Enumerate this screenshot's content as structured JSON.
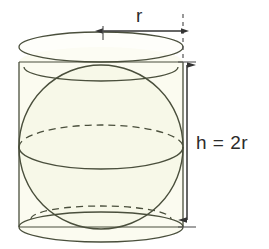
{
  "figure": {
    "background_color": "#ffffff",
    "stroke_color": "#4a4f3c",
    "fill_color": "#fbfbf0",
    "label_color": "#2b2b2b",
    "dimension_color": "#333333"
  },
  "labels": {
    "radius": "r",
    "height": "h = 2r"
  },
  "shapes": {
    "cylinder": {
      "name": "cylinder",
      "center_x": 101,
      "radius_x": 82,
      "top_ellipse_center_y": 62,
      "bottom_ellipse_center_y": 227,
      "ellipse_radius_y": 15
    },
    "sphere": {
      "name": "inscribed-sphere",
      "center_x": 101,
      "center_y": 147,
      "radius": 82,
      "equator_center_y": 147,
      "equator_radius_y": 22,
      "top_circle_center_y": 67,
      "top_circle_radius_x": 77,
      "top_circle_radius_y": 14,
      "bottom_circle_center_y": 219,
      "bottom_circle_radius_x": 70,
      "bottom_circle_radius_y": 13
    }
  },
  "dimensions": {
    "radius_arrow": {
      "name": "radius-dimension",
      "x_start": 103,
      "x_end": 183,
      "y": 31,
      "label": "r"
    },
    "height_arrow": {
      "name": "height-dimension",
      "x": 187,
      "y_start": 63,
      "y_end": 222,
      "label": "h = 2r"
    },
    "guide_line": {
      "name": "vertical-dashed-guide",
      "x": 183,
      "y_start": 14,
      "y_end": 62
    }
  }
}
